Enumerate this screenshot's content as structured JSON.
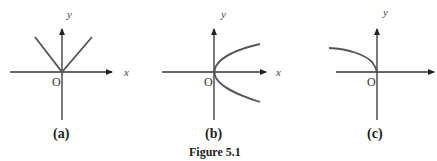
{
  "figure": {
    "caption": "Figure 5.1",
    "panels": [
      {
        "id": "a",
        "label": "(a)",
        "x_axis_label": "x",
        "y_axis_label": "y",
        "origin_label": "O",
        "curve": "V-shape: y = |x|"
      },
      {
        "id": "b",
        "label": "(b)",
        "x_axis_label": "x",
        "y_axis_label": "y",
        "origin_label": "O",
        "curve": "sideways parabola opening right: x = y^2"
      },
      {
        "id": "c",
        "label": "(c)",
        "x_axis_label": "",
        "y_axis_label": "y",
        "origin_label": "O",
        "curve": "upper-left branch: y = sqrt(-x)"
      }
    ]
  },
  "colors": {
    "axis": "#333333",
    "curve": "#555555",
    "background": "#ffffff"
  }
}
